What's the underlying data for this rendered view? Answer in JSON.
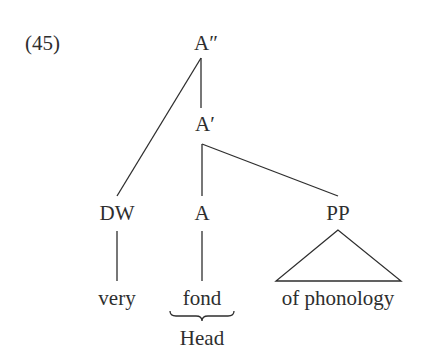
{
  "example_number": "(45)",
  "tree": {
    "nodes": {
      "a_double_bar": "A″",
      "a_bar": "A′",
      "dw": "DW",
      "a": "A",
      "pp": "PP"
    },
    "leaves": {
      "very": "very",
      "fond": "fond",
      "of_phonology": "of phonology"
    },
    "annotation": "Head"
  },
  "colors": {
    "ink": "#2e2e2e",
    "background": "#ffffff"
  }
}
